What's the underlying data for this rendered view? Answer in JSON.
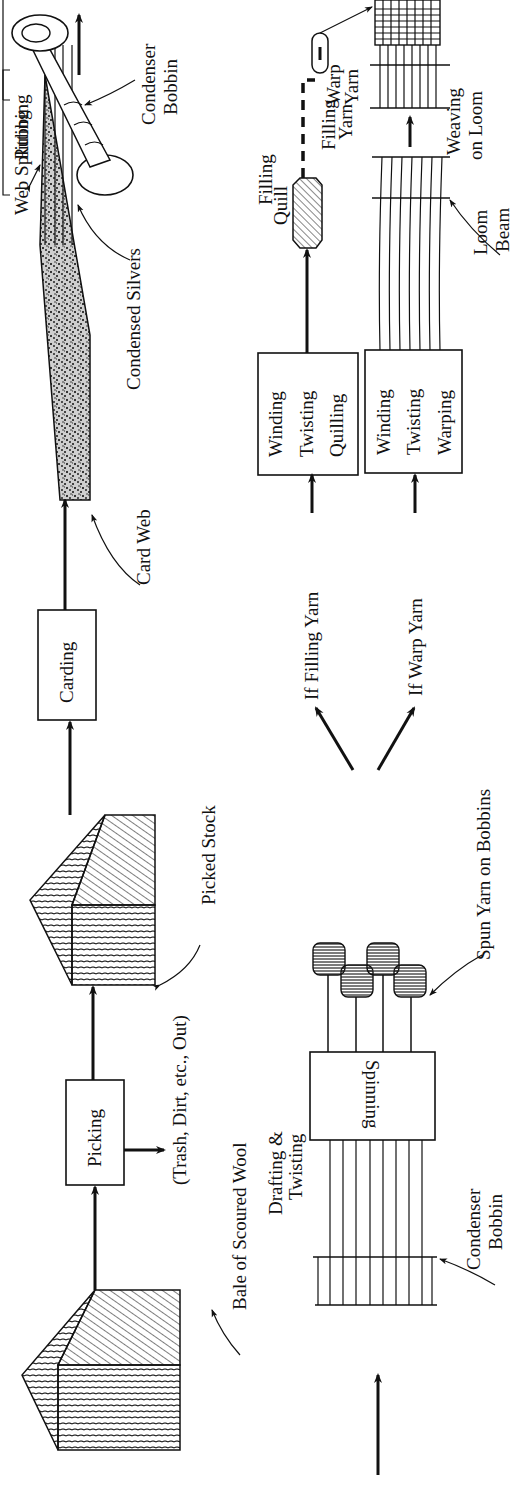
{
  "diagram": {
    "orientation": "rotated 90 degrees counterclockwise (reads bottom-to-top)",
    "colors": {
      "ink": "#111111",
      "background": "#ffffff"
    },
    "top_row": {
      "nodes": [
        {
          "id": "bale",
          "label": "Bale of Scoured Wool",
          "shape": "hatched-cube"
        },
        {
          "id": "picking",
          "label": "Picking",
          "shape": "box"
        },
        {
          "id": "trash",
          "label": "(Trash, Dirt, etc., Out)",
          "shape": "side-output"
        },
        {
          "id": "picked_stock",
          "label": "Picked Stock",
          "shape": "hatched-cube"
        },
        {
          "id": "carding",
          "label": "Carding",
          "shape": "box"
        },
        {
          "id": "card_web",
          "label": "Card Web",
          "shape": "speckled-web"
        },
        {
          "id": "web_splitting",
          "label": "Web Splitting",
          "shape": "bracket-label"
        },
        {
          "id": "rubbing",
          "label": "Rubbing",
          "shape": "bracket-label"
        },
        {
          "id": "condensed_silvers",
          "label": "Condensed Silvers",
          "shape": "strands"
        },
        {
          "id": "condenser_bobbin_top",
          "label": "Condenser Bobbin",
          "shape": "bobbin"
        }
      ]
    },
    "bottom_row": {
      "nodes": [
        {
          "id": "condenser_bobbin_bottom",
          "label": "Condenser Bobbin",
          "shape": "spool"
        },
        {
          "id": "spinning",
          "label": "Spinning",
          "shape": "box"
        },
        {
          "id": "drafting",
          "label": "Drafting & Twisting",
          "shape": "annotation"
        },
        {
          "id": "spun_yarn",
          "label": "Spun Yarn on Bobbins",
          "shape": "bobbins"
        },
        {
          "id": "if_filling",
          "label": "If Filling Yarn",
          "shape": "branch-label"
        },
        {
          "id": "if_warp",
          "label": "If Warp Yarn",
          "shape": "branch-label"
        },
        {
          "id": "wtq",
          "lines": [
            "Winding",
            "Twisting",
            "Quilling"
          ],
          "shape": "box"
        },
        {
          "id": "wtw",
          "lines": [
            "Winding",
            "Twisting",
            "Warping"
          ],
          "shape": "box"
        },
        {
          "id": "filling_quill",
          "lines": [
            "Filling",
            "Quill"
          ],
          "shape": "quill"
        },
        {
          "id": "loom_beam",
          "lines": [
            "Loom",
            "Beam"
          ],
          "shape": "spool"
        },
        {
          "id": "warp_yarn",
          "lines": [
            "Warp",
            "Yarn"
          ],
          "shape": "spool"
        },
        {
          "id": "filling_yarn",
          "lines": [
            "Filling",
            "Yarn"
          ],
          "shape": "annotation"
        },
        {
          "id": "weaving",
          "lines": [
            "Weaving",
            "on Loom"
          ],
          "shape": "grid"
        },
        {
          "id": "woven_fabric",
          "lines": [
            "Woven",
            "Fabric"
          ],
          "shape": "output"
        }
      ]
    }
  },
  "labels": {
    "bale": "Bale of Scoured Wool",
    "picking": "Picking",
    "trash": "(Trash, Dirt, etc., Out)",
    "picked_stock": "Picked Stock",
    "carding": "Carding",
    "card_web": "Card Web",
    "web_splitting": "Web Splitting",
    "rubbing": "Rubbing",
    "condensed_silvers": "Condensed Silvers",
    "condenser_top_1": "Condenser",
    "condenser_top_2": "Bobbin",
    "condenser_bot_1": "Condenser",
    "condenser_bot_2": "Bobbin",
    "spinning": "Spinning",
    "drafting_1": "Drafting &",
    "drafting_2": "Twisting",
    "spun_yarn": "Spun Yarn on Bobbins",
    "if_filling": "If Filling Yarn",
    "if_warp": "If Warp Yarn",
    "wtq_1": "Winding",
    "wtq_2": "Twisting",
    "wtq_3": "Quilling",
    "wtw_1": "Winding",
    "wtw_2": "Twisting",
    "wtw_3": "Warping",
    "quill_1": "Filling",
    "quill_2": "Quill",
    "loom_1": "Loom",
    "loom_2": "Beam",
    "warp_1": "Warp",
    "warp_2": "Yarn",
    "fillyarn_1": "Filling",
    "fillyarn_2": "Yarn",
    "weaving_1": "Weaving",
    "weaving_2": "on Loom",
    "woven_1": "Woven",
    "woven_2": "Fabric"
  }
}
